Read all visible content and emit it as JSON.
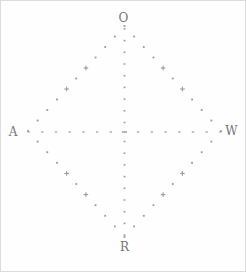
{
  "figure": {
    "background": "#fefefe",
    "mark_color": "#9a9a9a",
    "tick_color": "#a3a3a3",
    "center_dash_color": "#8f8f8f",
    "label_color": "#757575",
    "labels": {
      "top": "O",
      "left": "A",
      "right": "W",
      "bottom": "R"
    }
  },
  "chart_data": {
    "type": "scatter",
    "title": "",
    "vertex_labels": {
      "top": "O",
      "right": "W",
      "bottom": "R",
      "left": "A"
    },
    "diamond": {
      "vertices": {
        "top": [
          123.5,
          25
        ],
        "right": [
          220,
          130
        ],
        "bottom": [
          123.5,
          236
        ],
        "left": [
          27,
          130
        ]
      },
      "points_per_edge": 11,
      "plus_marker_indices": [
        4,
        6
      ]
    },
    "axes": {
      "horizontal": {
        "y": 131,
        "x_center": 123.5,
        "tick_spacing": 13.7,
        "ticks_each_side": 7
      },
      "vertical": {
        "x": 123.5,
        "y_center": 131,
        "first_offset": 9.5,
        "tick_spacing": 11.7,
        "ticks_each_side": 9
      },
      "center_dash": [
        123.5,
        131
      ]
    },
    "label_positions": {
      "top": [
        122.5,
        16.5
      ],
      "left": [
        12,
        131
      ],
      "right": [
        230.5,
        130
      ],
      "bottom": [
        123.5,
        245.5
      ]
    },
    "grid": false,
    "legend": false
  }
}
